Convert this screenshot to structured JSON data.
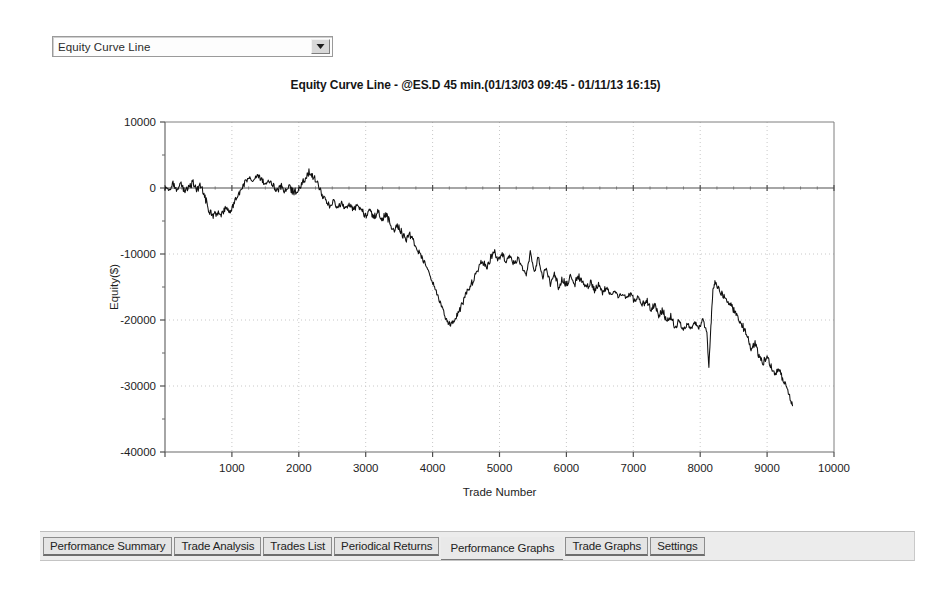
{
  "graph_selector": {
    "name": "graph-type-select",
    "selected": "Equity Curve Line",
    "options": [
      "Equity Curve Line",
      "Equity Curve Detailed",
      "Underwater Equity Curve",
      "Monthly Net Profit",
      "Trade Net Profit"
    ],
    "dropdown_icon": "chevron-down-icon"
  },
  "chart_title": "Equity Curve Line - @ES.D 45 min.(01/13/03 09:45 - 01/11/13 16:15)",
  "tabs": {
    "active": "Performance Graphs",
    "items": [
      {
        "label": "Performance Summary",
        "active": false
      },
      {
        "label": "Trade Analysis",
        "active": false
      },
      {
        "label": "Trades List",
        "active": false
      },
      {
        "label": "Periodical Returns",
        "active": false
      },
      {
        "label": "Performance Graphs",
        "active": true
      },
      {
        "label": "Trade Graphs",
        "active": false
      },
      {
        "label": "Settings",
        "active": false
      }
    ]
  },
  "colors": {
    "line": "#101010",
    "axis": "#4a4a4a",
    "grid": "#c8c8c8",
    "plot_background": "#ffffff",
    "page_background": "#ffffff",
    "tab_face": "#e4e4e4",
    "tab_strip": "#ececec"
  },
  "chart_data": {
    "type": "line",
    "title": "Equity Curve Line - @ES.D 45 min.(01/13/03 09:45 - 01/11/13 16:15)",
    "xlabel": "Trade Number",
    "ylabel": "Equity($)",
    "xlim": [
      0,
      10000
    ],
    "ylim": [
      -40000,
      10000
    ],
    "xticks": [
      0,
      1000,
      2000,
      3000,
      4000,
      5000,
      6000,
      7000,
      8000,
      9000,
      10000
    ],
    "xtick_labels": [
      "",
      "1000",
      "2000",
      "3000",
      "4000",
      "5000",
      "6000",
      "7000",
      "8000",
      "9000",
      "10000"
    ],
    "yticks": [
      10000,
      0,
      -10000,
      -20000,
      -30000,
      -40000
    ],
    "ytick_labels": [
      "10000",
      "0",
      "-10000",
      "-20000",
      "-30000",
      "-40000"
    ],
    "minor_tick_interval_y": 5000,
    "minor_tick_interval_x": 250,
    "grid": true,
    "grid_style": "dotted",
    "legend": false,
    "series": [
      {
        "name": "Equity Curve Line",
        "color": "#101010",
        "x": [
          0,
          60,
          120,
          180,
          240,
          300,
          360,
          420,
          480,
          540,
          600,
          660,
          720,
          780,
          840,
          900,
          960,
          1020,
          1080,
          1140,
          1200,
          1260,
          1320,
          1380,
          1440,
          1500,
          1560,
          1620,
          1680,
          1740,
          1800,
          1860,
          1920,
          1980,
          2040,
          2100,
          2160,
          2220,
          2280,
          2340,
          2400,
          2460,
          2520,
          2580,
          2640,
          2700,
          2760,
          2820,
          2880,
          2940,
          3000,
          3060,
          3120,
          3180,
          3240,
          3300,
          3360,
          3420,
          3480,
          3540,
          3600,
          3660,
          3720,
          3780,
          3840,
          3900,
          3960,
          4020,
          4080,
          4140,
          4200,
          4260,
          4320,
          4380,
          4440,
          4500,
          4560,
          4620,
          4680,
          4740,
          4800,
          4860,
          4920,
          4980,
          5040,
          5100,
          5160,
          5220,
          5280,
          5340,
          5400,
          5460,
          5520,
          5580,
          5640,
          5700,
          5760,
          5820,
          5880,
          5940,
          6000,
          6060,
          6120,
          6180,
          6240,
          6300,
          6360,
          6420,
          6480,
          6540,
          6600,
          6660,
          6720,
          6780,
          6840,
          6900,
          6960,
          7020,
          7080,
          7140,
          7200,
          7260,
          7320,
          7380,
          7440,
          7500,
          7560,
          7620,
          7680,
          7740,
          7800,
          7860,
          7920,
          7980,
          8040,
          8100,
          8130,
          8160,
          8190,
          8220,
          8280,
          8340,
          8400,
          8460,
          8520,
          8580,
          8640,
          8700,
          8760,
          8820,
          8880,
          8940,
          9000,
          9060,
          9120,
          9180,
          9240,
          9300,
          9380
        ],
        "y": [
          0,
          -400,
          700,
          -300,
          500,
          -600,
          200,
          800,
          -200,
          400,
          -1500,
          -3400,
          -4200,
          -3600,
          -4100,
          -3200,
          -3700,
          -2600,
          -1200,
          -400,
          900,
          1600,
          900,
          2000,
          1300,
          600,
          1100,
          300,
          -400,
          300,
          -500,
          200,
          -700,
          -300,
          600,
          1600,
          2600,
          1700,
          600,
          -900,
          -1700,
          -2600,
          -2100,
          -3000,
          -2300,
          -3200,
          -2500,
          -3300,
          -2600,
          -3400,
          -4200,
          -3400,
          -4400,
          -3600,
          -4700,
          -4000,
          -5200,
          -6400,
          -5600,
          -6800,
          -7800,
          -7000,
          -8200,
          -9400,
          -10600,
          -11800,
          -13200,
          -14800,
          -16400,
          -18200,
          -19800,
          -20800,
          -20200,
          -19000,
          -17600,
          -16200,
          -15000,
          -13600,
          -12200,
          -11000,
          -12100,
          -10800,
          -9600,
          -10900,
          -9800,
          -11200,
          -10200,
          -11600,
          -10600,
          -12000,
          -13400,
          -9800,
          -12800,
          -10400,
          -13600,
          -12200,
          -14600,
          -13000,
          -15000,
          -13800,
          -14800,
          -13600,
          -14600,
          -13400,
          -14400,
          -15200,
          -14200,
          -15600,
          -14600,
          -15800,
          -15000,
          -16200,
          -15400,
          -16600,
          -15800,
          -16800,
          -16000,
          -17200,
          -16400,
          -17600,
          -17000,
          -18400,
          -17600,
          -19200,
          -18400,
          -20200,
          -19400,
          -21000,
          -20200,
          -21600,
          -20600,
          -21400,
          -20400,
          -21200,
          -20000,
          -22000,
          -27200,
          -21000,
          -15400,
          -14200,
          -15400,
          -16200,
          -17000,
          -17800,
          -18800,
          -19800,
          -21000,
          -22600,
          -24200,
          -23600,
          -25400,
          -26400,
          -25600,
          -27000,
          -28200,
          -27400,
          -29200,
          -30400,
          -33000
        ]
      }
    ],
    "annotations": [
      {
        "text": "zero reference line",
        "y": 0,
        "style": "solid axis line across plot"
      }
    ],
    "summary": {
      "start_value": 0,
      "end_value": -33000,
      "max_value": 2600,
      "max_at_trade": 2160,
      "min_value": -33000,
      "min_at_trade": 9380,
      "largest_drawdown_bottom": -33000,
      "interim_trough": -21000,
      "interim_trough_at_trade": 4140,
      "spike_low": -27200,
      "spike_low_at_trade": 8130,
      "spike_high": -14200,
      "spike_high_at_trade": 8220
    }
  }
}
